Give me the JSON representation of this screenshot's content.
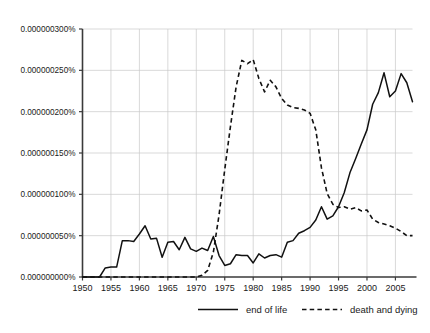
{
  "chart_data": {
    "type": "line",
    "title": "",
    "subtitle": "",
    "xlabel": "",
    "ylabel": "",
    "xlim": [
      1950,
      2008
    ],
    "ylim": [
      0.0,
      3e-07
    ],
    "grid": true,
    "legend_position": "bottom",
    "x_ticks": [
      1950,
      1955,
      1960,
      1965,
      1970,
      1975,
      1980,
      1985,
      1990,
      1995,
      2000,
      2005
    ],
    "x_tick_labels": [
      "1950",
      "1955",
      "1960",
      "1965",
      "1970",
      "1975",
      "1980",
      "1985",
      "1990",
      "1995",
      "2000",
      "2005"
    ],
    "y_ticks": [
      0.0,
      5e-08,
      1e-07,
      1.5e-07,
      2e-07,
      2.5e-07,
      3e-07
    ],
    "y_tick_labels": [
      "0.000000000%",
      "0.000000050%",
      "0.000000100%",
      "0.000000150%",
      "0.000000200%",
      "0.000000250%",
      "0.000000300%"
    ],
    "x": [
      1950,
      1951,
      1952,
      1953,
      1954,
      1955,
      1956,
      1957,
      1958,
      1959,
      1960,
      1961,
      1962,
      1963,
      1964,
      1965,
      1966,
      1967,
      1968,
      1969,
      1970,
      1971,
      1972,
      1973,
      1974,
      1975,
      1976,
      1977,
      1978,
      1979,
      1980,
      1981,
      1982,
      1983,
      1984,
      1985,
      1986,
      1987,
      1988,
      1989,
      1990,
      1991,
      1992,
      1993,
      1994,
      1995,
      1996,
      1997,
      1998,
      1999,
      2000,
      2001,
      2002,
      2003,
      2004,
      2005,
      2006,
      2007,
      2008
    ],
    "series": [
      {
        "name": "end of life",
        "style": "solid",
        "color": "#111111",
        "values": [
          0.0,
          0.0,
          0.0,
          0.0,
          1.1e-08,
          1.2e-08,
          1.2e-08,
          4.4e-08,
          4.4e-08,
          4.3e-08,
          5.2e-08,
          6.2e-08,
          4.6e-08,
          4.7e-08,
          2.4e-08,
          4.2e-08,
          4.3e-08,
          3.3e-08,
          4.8e-08,
          3.4e-08,
          3.1e-08,
          3.5e-08,
          3.2e-08,
          4.9e-08,
          2.6e-08,
          1.4e-08,
          1.6e-08,
          2.7e-08,
          2.6e-08,
          2.6e-08,
          1.7e-08,
          2.8e-08,
          2.3e-08,
          2.6e-08,
          2.7e-08,
          2.4e-08,
          4.2e-08,
          4.4e-08,
          5.3e-08,
          5.6e-08,
          6e-08,
          6.9e-08,
          8.5e-08,
          7e-08,
          7.4e-08,
          8.5e-08,
          1.02e-07,
          1.26e-07,
          1.43e-07,
          1.61e-07,
          1.78e-07,
          2.09e-07,
          2.23e-07,
          2.47e-07,
          2.18e-07,
          2.25e-07,
          2.46e-07,
          2.35e-07,
          2.12e-07
        ]
      },
      {
        "name": "death and dying",
        "style": "dashed",
        "color": "#111111",
        "values": [
          0.0,
          0.0,
          0.0,
          0.0,
          0.0,
          0.0,
          0.0,
          0.0,
          0.0,
          0.0,
          0.0,
          0.0,
          0.0,
          0.0,
          0.0,
          0.0,
          0.0,
          0.0,
          0.0,
          0.0,
          0.0,
          2e-09,
          8e-09,
          3e-08,
          7.5e-08,
          1.3e-07,
          1.82e-07,
          2.3e-07,
          2.62e-07,
          2.58e-07,
          2.63e-07,
          2.4e-07,
          2.24e-07,
          2.38e-07,
          2.3e-07,
          2.16e-07,
          2.08e-07,
          2.05e-07,
          2.04e-07,
          2.02e-07,
          1.98e-07,
          1.78e-07,
          1.32e-07,
          1.01e-07,
          8.8e-08,
          8.4e-08,
          8.5e-08,
          8.2e-08,
          8.4e-08,
          8e-08,
          8.1e-08,
          7e-08,
          6.6e-08,
          6.4e-08,
          6.2e-08,
          5.9e-08,
          5.5e-08,
          5e-08,
          5e-08
        ]
      }
    ],
    "legend": [
      {
        "label": "end of life",
        "style": "solid"
      },
      {
        "label": "death and dying",
        "style": "dashed"
      }
    ]
  }
}
